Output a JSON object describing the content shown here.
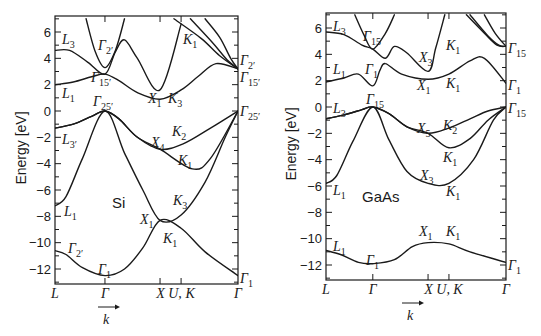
{
  "chart_data": [
    {
      "type": "line",
      "title": "Si band structure",
      "material_label": "Si",
      "xlabel": "k",
      "ylabel": "Energy [eV]",
      "ylim": [
        -13,
        7
      ],
      "yticks": [
        6,
        4,
        2,
        0,
        -2,
        -4,
        -6,
        -8,
        -10,
        -12
      ],
      "k_points": [
        "L",
        "Γ",
        "X",
        "U, K",
        "Γ"
      ],
      "k_positions": [
        0,
        0.273,
        0.574,
        0.689,
        1.0
      ],
      "frame_px": {
        "x0": 55,
        "x1": 238,
        "ytop": 16,
        "ybot": 284,
        "y6": 32,
        "y0": 111,
        "yn12": 270
      },
      "series": [
        {
          "name": "band1 (Γ1 lowest)",
          "points": [
            [
              0,
              -10.6
            ],
            [
              0.06,
              -10.9
            ],
            [
              0.15,
              -11.9
            ],
            [
              0.273,
              -12.5
            ],
            [
              0.38,
              -12.0
            ],
            [
              0.48,
              -10.4
            ],
            [
              0.574,
              -8.3
            ],
            [
              0.689,
              -8.9
            ],
            [
              0.82,
              -10.7
            ],
            [
              1.0,
              -12.5
            ]
          ]
        },
        {
          "name": "band2",
          "points": [
            [
              0,
              -7.2
            ],
            [
              0.06,
              -6.5
            ],
            [
              0.15,
              -3.6
            ],
            [
              0.273,
              0.0
            ],
            [
              0.38,
              -3.2
            ],
            [
              0.48,
              -6.0
            ],
            [
              0.574,
              -8.3
            ],
            [
              0.689,
              -7.9
            ],
            [
              0.82,
              -5.4
            ],
            [
              0.93,
              -2.0
            ],
            [
              1.0,
              0.0
            ]
          ]
        },
        {
          "name": "band3",
          "points": [
            [
              0,
              -1.3
            ],
            [
              0.1,
              -1.0
            ],
            [
              0.2,
              -0.4
            ],
            [
              0.273,
              0.0
            ],
            [
              0.35,
              -0.6
            ],
            [
              0.45,
              -2.0
            ],
            [
              0.574,
              -2.9
            ],
            [
              0.75,
              -4.4
            ],
            [
              0.85,
              -3.6
            ],
            [
              1.0,
              0.0
            ]
          ]
        },
        {
          "name": "band4",
          "points": [
            [
              0,
              -1.3
            ],
            [
              0.1,
              -1.0
            ],
            [
              0.2,
              -0.4
            ],
            [
              0.273,
              0.0
            ],
            [
              0.35,
              -0.6
            ],
            [
              0.45,
              -2.0
            ],
            [
              0.574,
              -2.9
            ],
            [
              0.7,
              -2.5
            ],
            [
              0.85,
              -1.3
            ],
            [
              1.0,
              0.0
            ]
          ]
        },
        {
          "name": "band5",
          "points": [
            [
              0,
              2.0
            ],
            [
              0.1,
              2.2
            ],
            [
              0.2,
              2.6
            ],
            [
              0.273,
              2.8
            ],
            [
              0.35,
              2.3
            ],
            [
              0.45,
              1.4
            ],
            [
              0.574,
              0.9
            ],
            [
              0.689,
              1.6
            ],
            [
              0.78,
              2.6
            ],
            [
              0.88,
              3.6
            ],
            [
              1.0,
              3.2
            ]
          ]
        },
        {
          "name": "band6",
          "points": [
            [
              0,
              4.6
            ],
            [
              0.08,
              4.6
            ],
            [
              0.18,
              3.7
            ],
            [
              0.273,
              2.8
            ],
            [
              0.33,
              4.5
            ],
            [
              0.38,
              5.4
            ],
            [
              0.45,
              4.0
            ],
            [
              0.574,
              1.6
            ],
            [
              0.689,
              6.6
            ]
          ]
        },
        {
          "name": "band7",
          "points": [
            [
              0.17,
              7.0
            ],
            [
              0.22,
              4.5
            ],
            [
              0.273,
              3.3
            ],
            [
              0.33,
              4.6
            ],
            [
              0.38,
              7.0
            ]
          ]
        },
        {
          "name": "band8",
          "points": [
            [
              0.65,
              7.0
            ],
            [
              0.8,
              5.5
            ],
            [
              0.9,
              4.2
            ],
            [
              1.0,
              3.2
            ]
          ]
        },
        {
          "name": "band9",
          "points": [
            [
              0.74,
              7.0
            ],
            [
              0.86,
              5.2
            ],
            [
              0.94,
              3.9
            ],
            [
              1.0,
              3.2
            ]
          ]
        },
        {
          "name": "band10",
          "points": [
            [
              0.82,
              7.0
            ],
            [
              0.9,
              5.6
            ],
            [
              0.96,
              4.0
            ],
            [
              1.0,
              3.2
            ]
          ]
        }
      ],
      "annotations": [
        "L3",
        "Γ2'",
        "Γ15'",
        "L1",
        "Γ25'",
        "X1",
        "K3",
        "L3'",
        "X4",
        "K2",
        "K1",
        "Si",
        "L1",
        "X1",
        "K3",
        "K1",
        "Γ2'",
        "Γ1",
        "Γ2'",
        "Γ15'",
        "Γ25'",
        "Γ1"
      ]
    },
    {
      "type": "line",
      "title": "GaAs band structure",
      "material_label": "GaAs",
      "xlabel": "k",
      "ylabel": "Energy [eV]",
      "ylim": [
        -13,
        7
      ],
      "yticks": [
        6,
        4,
        2,
        0,
        -2,
        -4,
        -6,
        -8,
        -10,
        -12
      ],
      "k_points": [
        "L",
        "Γ",
        "X",
        "U, K",
        "Γ"
      ],
      "k_positions": [
        0,
        0.26,
        0.567,
        0.683,
        1.0
      ],
      "frame_px": {
        "x0": 326,
        "x1": 506,
        "ytop": 13,
        "ybot": 280,
        "y6": 28,
        "y0": 107,
        "yn12": 266
      },
      "series": [
        {
          "name": "band1 (lowest)",
          "points": [
            [
              0,
              -10.9
            ],
            [
              0.08,
              -11.2
            ],
            [
              0.18,
              -11.8
            ],
            [
              0.26,
              -11.9
            ],
            [
              0.38,
              -11.6
            ],
            [
              0.48,
              -10.6
            ],
            [
              0.567,
              -10.3
            ],
            [
              0.683,
              -10.4
            ],
            [
              0.8,
              -11.0
            ],
            [
              1.0,
              -11.8
            ]
          ]
        },
        {
          "name": "band2",
          "points": [
            [
              0,
              -5.8
            ],
            [
              0.06,
              -5.2
            ],
            [
              0.15,
              -2.6
            ],
            [
              0.26,
              0.0
            ],
            [
              0.35,
              -2.5
            ],
            [
              0.45,
              -4.9
            ],
            [
              0.567,
              -5.8
            ],
            [
              0.683,
              -5.8
            ],
            [
              0.82,
              -4.0
            ],
            [
              0.93,
              -1.0
            ],
            [
              1.0,
              0.0
            ]
          ]
        },
        {
          "name": "band3",
          "points": [
            [
              0,
              -0.9
            ],
            [
              0.1,
              -0.6
            ],
            [
              0.2,
              -0.2
            ],
            [
              0.26,
              0.0
            ],
            [
              0.35,
              -0.5
            ],
            [
              0.45,
              -1.5
            ],
            [
              0.567,
              -2.0
            ],
            [
              0.683,
              -3.1
            ],
            [
              0.8,
              -2.4
            ],
            [
              0.9,
              -1.0
            ],
            [
              1.0,
              0.0
            ]
          ]
        },
        {
          "name": "band4",
          "points": [
            [
              0,
              -0.9
            ],
            [
              0.1,
              -0.6
            ],
            [
              0.2,
              -0.2
            ],
            [
              0.26,
              0.0
            ],
            [
              0.35,
              -0.5
            ],
            [
              0.45,
              -1.5
            ],
            [
              0.567,
              -2.0
            ],
            [
              0.683,
              -1.6
            ],
            [
              0.8,
              -0.9
            ],
            [
              0.9,
              -0.3
            ],
            [
              1.0,
              0.0
            ]
          ]
        },
        {
          "name": "band5",
          "points": [
            [
              0,
              1.9
            ],
            [
              0.1,
              2.2
            ],
            [
              0.18,
              2.5
            ],
            [
              0.26,
              1.6
            ],
            [
              0.3,
              2.8
            ],
            [
              0.33,
              3.3
            ],
            [
              0.42,
              2.5
            ],
            [
              0.567,
              2.1
            ],
            [
              0.683,
              2.5
            ],
            [
              0.8,
              3.5
            ],
            [
              0.88,
              3.7
            ],
            [
              1.0,
              1.8
            ]
          ]
        },
        {
          "name": "band6",
          "points": [
            [
              0,
              5.7
            ],
            [
              0.1,
              5.5
            ],
            [
              0.2,
              4.7
            ],
            [
              0.26,
              4.4
            ],
            [
              0.33,
              3.7
            ],
            [
              0.38,
              4.6
            ],
            [
              0.45,
              4.1
            ],
            [
              0.567,
              2.7
            ],
            [
              0.61,
              4.5
            ],
            [
              0.66,
              7.0
            ]
          ]
        },
        {
          "name": "band7",
          "points": [
            [
              0.16,
              7.0
            ],
            [
              0.21,
              5.5
            ],
            [
              0.26,
              4.4
            ],
            [
              0.33,
              5.6
            ],
            [
              0.38,
              7.0
            ]
          ]
        },
        {
          "name": "band8",
          "points": [
            [
              0.78,
              7.0
            ],
            [
              0.88,
              5.6
            ],
            [
              0.95,
              4.7
            ],
            [
              1.0,
              4.6
            ]
          ]
        },
        {
          "name": "band9",
          "points": [
            [
              0.8,
              7.0
            ],
            [
              0.9,
              5.4
            ],
            [
              0.96,
              4.7
            ],
            [
              1.0,
              4.6
            ]
          ]
        },
        {
          "name": "band10",
          "points": [
            [
              0.88,
              7.0
            ],
            [
              0.94,
              5.6
            ],
            [
              1.0,
              4.6
            ]
          ]
        }
      ],
      "annotations": [
        "L3",
        "Γ15",
        "X3",
        "K1",
        "L1",
        "Γ1",
        "X1",
        "K1",
        "Γ15",
        "Γ1",
        "L3",
        "Γ15",
        "X5",
        "K2",
        "K1",
        "X3",
        "K1",
        "L1",
        "GaAs",
        "X1",
        "K1",
        "L1",
        "Γ1",
        "Γ1",
        "Γ15"
      ]
    }
  ],
  "axes": {
    "ylabel": "Energy [eV]",
    "yticks": [
      "6",
      "4",
      "2",
      "0",
      "−2",
      "−4",
      "−6",
      "−8",
      "−10",
      "−12"
    ],
    "xticks": [
      "L",
      "Γ",
      "X U,",
      "K",
      "Γ"
    ],
    "k_arrow_label": "k"
  },
  "panels": {
    "si": {
      "material": "Si",
      "labels": [
        {
          "t": "L",
          "s": "3",
          "x": 62,
          "y": 44
        },
        {
          "t": "Γ",
          "s": "2′",
          "x": 98,
          "y": 50
        },
        {
          "t": "K",
          "s": "1",
          "x": 183,
          "y": 44
        },
        {
          "t": "Γ",
          "s": "2′",
          "x": 240,
          "y": 65
        },
        {
          "t": "Γ",
          "s": "15′",
          "x": 91,
          "y": 82
        },
        {
          "t": "Γ",
          "s": "15′",
          "x": 240,
          "y": 82
        },
        {
          "t": "L",
          "s": "1",
          "x": 62,
          "y": 98
        },
        {
          "t": "X",
          "s": "1",
          "x": 148,
          "y": 103
        },
        {
          "t": "K",
          "s": "3",
          "x": 168,
          "y": 103
        },
        {
          "t": "Γ",
          "s": "25′",
          "x": 93,
          "y": 106
        },
        {
          "t": "Γ",
          "s": "25′",
          "x": 240,
          "y": 116
        },
        {
          "t": "L",
          "s": "3′",
          "x": 62,
          "y": 144
        },
        {
          "t": "X",
          "s": "4",
          "x": 151,
          "y": 147
        },
        {
          "t": "K",
          "s": "2",
          "x": 172,
          "y": 136
        },
        {
          "t": "K",
          "s": "1",
          "x": 178,
          "y": 165
        },
        {
          "t": "K",
          "s": "3",
          "x": 173,
          "y": 205
        },
        {
          "t": "L",
          "s": "1",
          "x": 64,
          "y": 216
        },
        {
          "t": "X",
          "s": "1",
          "x": 140,
          "y": 224
        },
        {
          "t": "K",
          "s": "1",
          "x": 163,
          "y": 243
        },
        {
          "t": "Γ",
          "s": "2′",
          "x": 68,
          "y": 253
        },
        {
          "t": "Γ",
          "s": "1",
          "x": 98,
          "y": 274
        },
        {
          "t": "Γ",
          "s": "1",
          "x": 240,
          "y": 283
        }
      ]
    },
    "gaas": {
      "material": "GaAs",
      "labels": [
        {
          "t": "L",
          "s": "3",
          "x": 333,
          "y": 31
        },
        {
          "t": "Γ",
          "s": "15",
          "x": 363,
          "y": 41
        },
        {
          "t": "X",
          "s": "3",
          "x": 419,
          "y": 62
        },
        {
          "t": "K",
          "s": "1",
          "x": 446,
          "y": 50
        },
        {
          "t": "Γ",
          "s": "15",
          "x": 508,
          "y": 53
        },
        {
          "t": "L",
          "s": "1",
          "x": 333,
          "y": 74
        },
        {
          "t": "Γ",
          "s": "1",
          "x": 365,
          "y": 74
        },
        {
          "t": "X",
          "s": "1",
          "x": 417,
          "y": 90
        },
        {
          "t": "K",
          "s": "1",
          "x": 446,
          "y": 88
        },
        {
          "t": "Γ",
          "s": "1",
          "x": 508,
          "y": 90
        },
        {
          "t": "L",
          "s": "3",
          "x": 333,
          "y": 113
        },
        {
          "t": "Γ",
          "s": "15",
          "x": 366,
          "y": 104
        },
        {
          "t": "Γ",
          "s": "15",
          "x": 508,
          "y": 113
        },
        {
          "t": "X",
          "s": "5",
          "x": 417,
          "y": 133
        },
        {
          "t": "K",
          "s": "2",
          "x": 443,
          "y": 130
        },
        {
          "t": "K",
          "s": "1",
          "x": 443,
          "y": 162
        },
        {
          "t": "X",
          "s": "3",
          "x": 420,
          "y": 180
        },
        {
          "t": "K",
          "s": "1",
          "x": 446,
          "y": 196
        },
        {
          "t": "L",
          "s": "1",
          "x": 333,
          "y": 195
        },
        {
          "t": "X",
          "s": "1",
          "x": 419,
          "y": 236
        },
        {
          "t": "K",
          "s": "1",
          "x": 446,
          "y": 236
        },
        {
          "t": "L",
          "s": "1",
          "x": 333,
          "y": 251
        },
        {
          "t": "Γ",
          "s": "1",
          "x": 366,
          "y": 265
        },
        {
          "t": "Γ",
          "s": "1",
          "x": 508,
          "y": 270
        }
      ]
    }
  }
}
